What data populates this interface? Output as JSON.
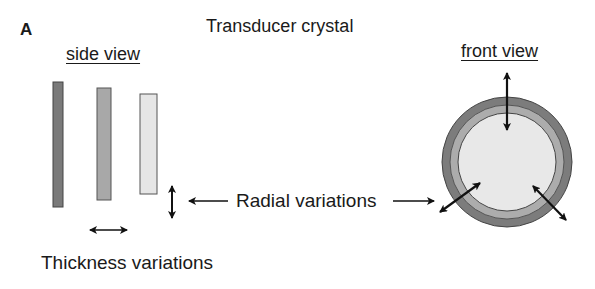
{
  "figure": {
    "panel_label": "A",
    "title": "Transducer crystal",
    "side_view_label": "side view",
    "front_view_label": "front view",
    "radial_label": "Radial variations",
    "thickness_label": "Thickness variations"
  },
  "side_view_bars": [
    {
      "name": "thick",
      "fill": "#7a7a7a"
    },
    {
      "name": "medium",
      "fill": "#a8a8a8"
    },
    {
      "name": "thin",
      "fill": "#e6e6e6"
    }
  ],
  "front_view_rings": [
    {
      "name": "outer-ring",
      "fill": "#7c7c7c"
    },
    {
      "name": "middle-ring",
      "fill": "#acacac"
    },
    {
      "name": "inner-disc",
      "fill": "#e8e8e8"
    }
  ]
}
